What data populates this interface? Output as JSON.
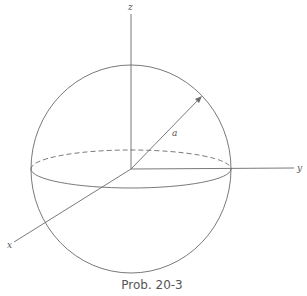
{
  "figure": {
    "caption": "Prob. 20-3",
    "axes": {
      "z": "z",
      "y": "y",
      "x": "x"
    },
    "radius_label": "a"
  },
  "colors": {
    "stroke": "#6a6a6a",
    "text": "#555555",
    "background": "#ffffff"
  }
}
